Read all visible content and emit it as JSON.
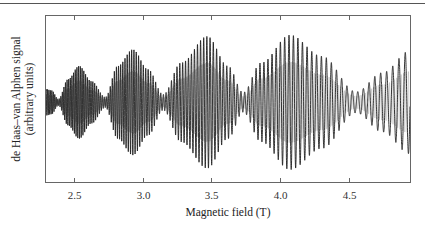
{
  "chart_data": {
    "type": "line",
    "title": "",
    "xlabel": "Magnetic field (T)",
    "ylabel": "de Haas–van Alphen signal (arbitrary units)",
    "ylabel_lines": [
      "de Haas–van Alphen signal",
      "(arbitrary units)"
    ],
    "xlim": [
      2.3,
      4.94
    ],
    "xticks": [
      2.5,
      3.0,
      3.5,
      4.0,
      4.5
    ],
    "xtick_labels": [
      "2.5",
      "3.0",
      "3.5",
      "4.0",
      "4.5"
    ],
    "yticks": [],
    "grid": false,
    "legend": null,
    "envelope": {
      "note": "relative half-amplitude of oscillations (1.0 = largest lobe), read from plot",
      "B": [
        2.3,
        2.34,
        2.39,
        2.46,
        2.54,
        2.63,
        2.73,
        2.82,
        2.93,
        3.04,
        3.15,
        3.28,
        3.47,
        3.62,
        3.73,
        3.86,
        4.07,
        4.3,
        4.55,
        4.74,
        4.94
      ],
      "amplitude": [
        0.2,
        0.18,
        0.05,
        0.35,
        0.55,
        0.32,
        0.08,
        0.55,
        0.8,
        0.5,
        0.12,
        0.6,
        1.0,
        0.55,
        0.15,
        0.6,
        1.02,
        0.7,
        0.16,
        0.45,
        0.78
      ]
    },
    "beat_nodes_T": [
      2.39,
      2.73,
      3.15,
      3.73,
      4.55
    ],
    "beat_maxima_T": [
      2.54,
      2.93,
      3.47,
      4.07
    ],
    "signal_center_fraction": 0.52
  },
  "colors": {
    "ink": "#1e1e1e",
    "frame": "#666666",
    "rule": "#555555"
  }
}
